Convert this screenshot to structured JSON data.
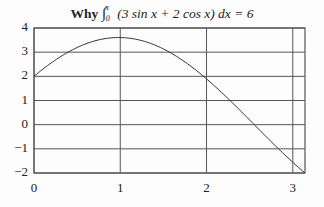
{
  "title": {
    "prefix": "Why",
    "integral_lower": "0",
    "integral_upper": "π",
    "integrand": "(3 sin x + 2 cos x) dx = 6"
  },
  "colors": {
    "line": "#333333",
    "grid": "#555555",
    "background": "#fdfdfd"
  },
  "chart_data": {
    "type": "line",
    "xlabel": "",
    "ylabel": "",
    "xlim": [
      0,
      3.1416
    ],
    "ylim": [
      -2,
      4
    ],
    "grid": true,
    "x_ticks": [
      0,
      1,
      2,
      3
    ],
    "y_ticks": [
      4,
      3,
      2,
      1,
      0,
      -1,
      -2
    ],
    "x_tick_labels": [
      "0",
      "1",
      "2",
      "3"
    ],
    "y_tick_labels": [
      "4",
      "3",
      "2",
      "1",
      "0",
      "−1",
      "−2"
    ],
    "series": [
      {
        "name": "3 sin x + 2 cos x",
        "x": [
          0,
          0.25,
          0.5,
          0.75,
          1.0,
          1.25,
          1.5,
          1.75,
          2.0,
          2.25,
          2.5,
          2.75,
          3.0,
          3.1416
        ],
        "y": [
          2.0,
          2.68,
          3.19,
          3.51,
          3.6,
          3.48,
          3.13,
          2.59,
          1.9,
          1.08,
          0.19,
          -0.71,
          -1.56,
          -2.0
        ]
      }
    ]
  }
}
